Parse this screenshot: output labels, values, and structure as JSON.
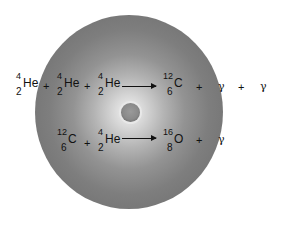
{
  "diagram": {
    "type": "stellar-nucleosynthesis",
    "colors": {
      "sphere_outer": "#6c6c6c",
      "sphere_inner": "#f2f2f2",
      "text": "#111111",
      "background": "#ffffff"
    },
    "reaction1": {
      "reactants": [
        {
          "mass": "4",
          "atomic": "2",
          "symbol": "He"
        },
        {
          "mass": "4",
          "atomic": "2",
          "symbol": "He"
        },
        {
          "mass": "4",
          "atomic": "2",
          "symbol": "He"
        }
      ],
      "products": [
        {
          "mass": "12",
          "atomic": "6",
          "symbol": "C"
        }
      ],
      "photons": [
        "γ",
        "γ"
      ],
      "plus": "+"
    },
    "reaction2": {
      "reactants": [
        {
          "mass": "12",
          "atomic": "6",
          "symbol": "C"
        },
        {
          "mass": "4",
          "atomic": "2",
          "symbol": "He"
        }
      ],
      "products": [
        {
          "mass": "16",
          "atomic": "8",
          "symbol": "O"
        }
      ],
      "photons": [
        "γ"
      ],
      "plus": "+"
    }
  }
}
